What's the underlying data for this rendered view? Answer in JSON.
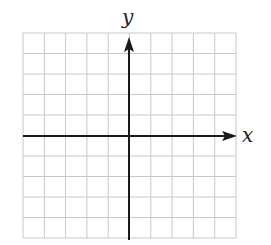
{
  "diagram": {
    "type": "coordinate-plane",
    "grid": {
      "columns": 10,
      "rows": 10,
      "line_color": "#c8c8c8"
    },
    "axes": {
      "color": "#1a1a1a",
      "x_label": "x",
      "y_label": "y",
      "x_arrow": "right",
      "y_arrow": "up"
    },
    "colors": {
      "background": "#ffffff"
    }
  }
}
